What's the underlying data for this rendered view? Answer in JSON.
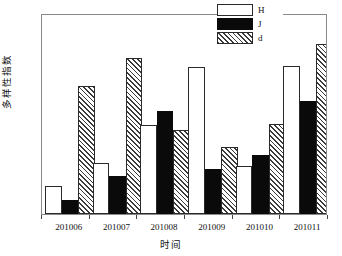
{
  "chart_data": {
    "type": "bar",
    "title": "",
    "xlabel": "时间",
    "ylabel": "多样性指数",
    "categories": [
      "201006",
      "201007",
      "201008",
      "201009",
      "201010",
      "201011"
    ],
    "series": [
      {
        "name": "H",
        "fill": "white",
        "values": [
          0.22,
          0.41,
          0.71,
          1.17,
          0.38,
          1.18
        ]
      },
      {
        "name": "J",
        "fill": "black",
        "values": [
          0.11,
          0.3,
          0.82,
          0.36,
          0.47,
          0.9
        ]
      },
      {
        "name": "d",
        "fill": "hatched",
        "values": [
          1.02,
          1.24,
          0.67,
          0.53,
          0.72,
          1.35
        ]
      }
    ],
    "ylim": [
      0.0,
      1.6
    ],
    "ytick_labels": [
      "0.0",
      "0.2",
      "0.4",
      "0.6",
      "0.8",
      "1.0",
      "1.2",
      "1.4",
      "1.6"
    ],
    "ytick_values": [
      0.0,
      0.2,
      0.4,
      0.6,
      0.8,
      1.0,
      1.2,
      1.4,
      1.6
    ],
    "grid": false,
    "legend_position": "top-right",
    "legend_entries": [
      "H",
      "J",
      "d"
    ]
  },
  "colors": {
    "frame": "#8a8a8a",
    "bar_outline": "#2a2a2a",
    "series_H": "#ffffff",
    "series_J": "#0a0a0a",
    "series_d_hatch": "#3a3a3a",
    "background": "#ffffff",
    "text": "#111111"
  }
}
